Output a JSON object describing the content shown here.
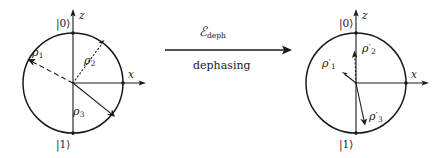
{
  "figure": {
    "background": "#ffffff",
    "ink": "#1a1a1a",
    "left_diagram": {
      "name": "bloch-circle-initial",
      "center": [
        73,
        83
      ],
      "radius": 50,
      "axis_z_label": "z",
      "axis_x_label": "x",
      "ket_top": "|0⟩",
      "ket_bottom": "|1⟩",
      "vectors": [
        {
          "name": "rho-1",
          "label_base": "ρ",
          "label_sub": "1",
          "style": "dashed",
          "angle_deg": 155,
          "length": 50
        },
        {
          "name": "rho-2",
          "label_base": "ρ",
          "label_sub": "2",
          "style": "dotted",
          "angle_deg": 52,
          "length": 50
        },
        {
          "name": "rho-3",
          "label_base": "ρ",
          "label_sub": "3",
          "style": "solid",
          "angle_deg": -39,
          "length": 50
        }
      ]
    },
    "arrow": {
      "name": "dephasing-arrow",
      "operator_base": "ℰ",
      "operator_sub": "deph",
      "caption": "dephasing",
      "x_start": 165,
      "x_end": 292,
      "y": 50
    },
    "right_diagram": {
      "name": "bloch-circle-final",
      "center": [
        356,
        83
      ],
      "radius": 50,
      "axis_z_label": "z",
      "axis_x_label": "x",
      "ket_top": "|0⟩",
      "ket_bottom": "|1⟩",
      "vectors": [
        {
          "name": "rho-1-prime",
          "label_base": "ρ",
          "label_prime": "′",
          "label_sub": "1",
          "style": "solid",
          "angle_deg": 143,
          "length": 17
        },
        {
          "name": "rho-2-prime",
          "label_base": "ρ",
          "label_prime": "′",
          "label_sub": "2",
          "style": "dotted",
          "angle_deg": 92,
          "length": 33
        },
        {
          "name": "rho-3-prime",
          "label_base": "ρ",
          "label_prime": "′",
          "label_sub": "3",
          "style": "solid",
          "angle_deg": -78,
          "length": 46
        }
      ]
    }
  }
}
